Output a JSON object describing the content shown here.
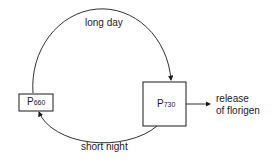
{
  "diagram": {
    "type": "cycle",
    "nodes": [
      {
        "id": "p660",
        "label": "P",
        "subscript": "660"
      },
      {
        "id": "p730",
        "label": "P",
        "subscript": "730"
      }
    ],
    "edges": [
      {
        "from": "p660",
        "to": "p730",
        "label": "long day"
      },
      {
        "from": "p730",
        "to": "p660",
        "label": "short night"
      },
      {
        "from": "p730",
        "to": "output",
        "label": "release of florigen"
      }
    ],
    "labels": {
      "long_day": "long day",
      "short_night": "short night",
      "output_line1": "release",
      "output_line2": "of florigen"
    },
    "colors": {
      "stroke": "#1a1a1a",
      "background": "#ffffff"
    }
  }
}
